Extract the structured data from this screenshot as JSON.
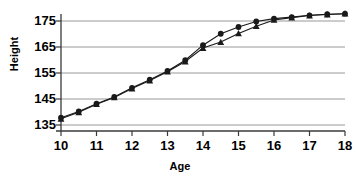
{
  "chart_data": {
    "type": "line",
    "title": "",
    "xlabel": "Age",
    "ylabel": "Height",
    "xlim": [
      10,
      18
    ],
    "ylim": [
      135,
      180
    ],
    "grid": true,
    "grid_axis": "y",
    "legend": "none",
    "xticks": [
      10,
      11,
      12,
      13,
      14,
      15,
      16,
      17,
      18
    ],
    "xtick_labels": [
      "10",
      "11",
      "12",
      "13",
      "14",
      "15",
      "16",
      "17",
      "18"
    ],
    "yticks": [
      135,
      145,
      155,
      165,
      175
    ],
    "ytick_labels": [
      "135",
      "145",
      "155",
      "165",
      "175"
    ],
    "x": [
      10,
      10.5,
      11,
      11.5,
      12,
      12.5,
      13,
      13.5,
      14,
      14.5,
      15,
      15.5,
      16,
      16.5,
      17,
      17.5,
      18
    ],
    "series": [
      {
        "name": "series-1",
        "marker": "circle",
        "color": "#1a1a1a",
        "values": [
          137.8,
          140.2,
          143.2,
          145.8,
          149.3,
          152.4,
          155.8,
          159.9,
          165.7,
          170.1,
          172.7,
          174.8,
          175.9,
          176.5,
          177.2,
          177.6,
          177.8
        ]
      },
      {
        "name": "series-2",
        "marker": "triangle",
        "color": "#1a1a1a",
        "values": [
          137.4,
          139.9,
          143.0,
          145.6,
          149.0,
          152.1,
          155.5,
          159.4,
          164.6,
          166.9,
          170.2,
          173.0,
          175.4,
          176.3,
          177.1,
          177.5,
          177.8
        ]
      }
    ]
  },
  "axes": {
    "x_title": "Age",
    "y_title": "Height"
  }
}
